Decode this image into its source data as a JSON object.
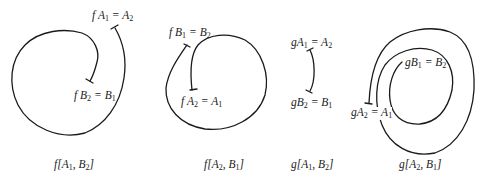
{
  "panels": [
    {
      "caption": {
        "fn": "f",
        "a": "A",
        "a_sub": "1",
        "b": "B",
        "b_sub": "2"
      },
      "start_label": {
        "fn": "f",
        "lhs": "A",
        "lhs_sub": "1",
        "rhs": "A",
        "rhs_sub": "2"
      },
      "end_label": {
        "fn": "f",
        "lhs": "B",
        "lhs_sub": "2",
        "rhs": "B",
        "rhs_sub": "1"
      }
    },
    {
      "caption": {
        "fn": "f",
        "a": "A",
        "a_sub": "2",
        "b": "B",
        "b_sub": "1"
      },
      "start_label": {
        "fn": "f",
        "lhs": "B",
        "lhs_sub": "1",
        "rhs": "B",
        "rhs_sub": "2"
      },
      "end_label": {
        "fn": "f",
        "lhs": "A",
        "lhs_sub": "2",
        "rhs": "A",
        "rhs_sub": "1"
      }
    },
    {
      "caption": {
        "fn": "g",
        "a": "A",
        "a_sub": "1",
        "b": "B",
        "b_sub": "2"
      },
      "start_label": {
        "fn": "g",
        "lhs": "A",
        "lhs_sub": "1",
        "rhs": "A",
        "rhs_sub": "2"
      },
      "end_label": {
        "fn": "g",
        "lhs": "B",
        "lhs_sub": "2",
        "rhs": "B",
        "rhs_sub": "1"
      }
    },
    {
      "caption": {
        "fn": "g",
        "a": "A",
        "a_sub": "2",
        "b": "B",
        "b_sub": "1"
      },
      "start_label": {
        "fn": "g",
        "lhs": "B",
        "lhs_sub": "1",
        "rhs": "B",
        "rhs_sub": "2"
      },
      "end_label": {
        "fn": "g",
        "lhs": "A",
        "lhs_sub": "2",
        "rhs": "A",
        "rhs_sub": "1"
      }
    }
  ],
  "style": {
    "stroke": "#1a1a1a",
    "background": "#ffffff"
  }
}
